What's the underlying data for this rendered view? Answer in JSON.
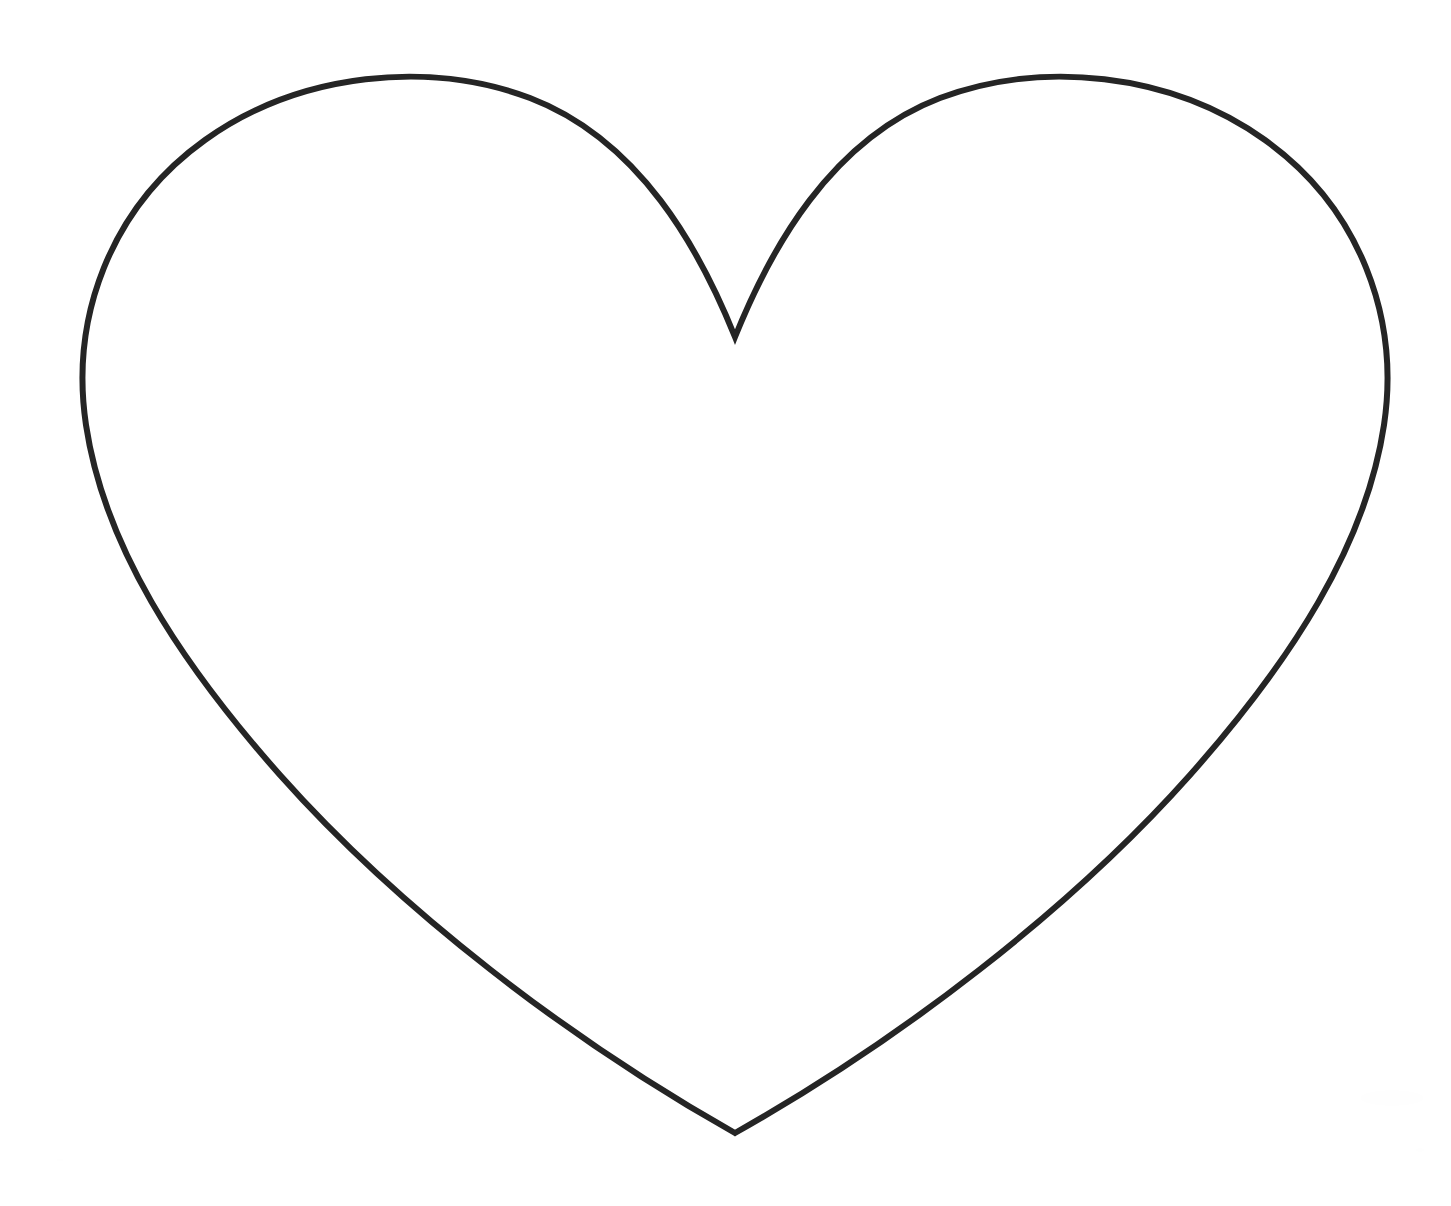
{
  "image": {
    "title": "Heart Outline Drawing",
    "subject": "heart",
    "style": "line-art outline, coloring-page template",
    "width": 1451,
    "height": 1206,
    "background_color": "#ffffff",
    "stroke_color": "#252525",
    "stroke_width": 6,
    "fill": "none",
    "alt_text": "A large symmetric heart shape drawn as a thin black outline on a plain white background."
  },
  "shape": {
    "name": "heart",
    "symmetry_axis_x": 735,
    "key_points": {
      "bottom_tip": [
        735,
        1133
      ],
      "top_cleft_notch": [
        735,
        337
      ],
      "left_lobe_apex": [
        375,
        81
      ],
      "right_lobe_apex": [
        1075,
        81
      ],
      "leftmost": [
        83,
        410
      ],
      "rightmost": [
        1385,
        410
      ]
    },
    "bounding_box": {
      "left": 83,
      "top": 78,
      "right": 1385,
      "bottom": 1133,
      "width": 1302,
      "height": 1055
    },
    "path_d": "M 735 337 C 700 250 640 140 530 98 C 430 60 300 72 205 140 C 110 208 70 318 86 425 C 104 545 178 660 280 775 C 400 910 570 1040 735 1133 C 900 1040 1070 910 1190 775 C 1292 660 1366 545 1384 425 C 1400 318 1360 208 1265 140 C 1170 72 1040 60 940 98 C 830 140 770 250 735 337 Z"
  },
  "labels": {
    "canvas_label": "drawing-canvas",
    "figure_label": "heart-outline"
  }
}
